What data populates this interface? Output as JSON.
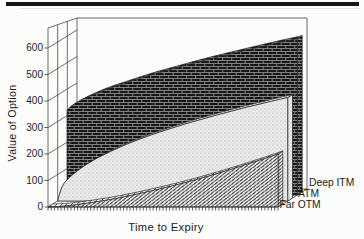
{
  "figure": {
    "kind": "scanned textbook 3D area chart",
    "top_rule_color": "#151515",
    "background": "#fcfcfa"
  },
  "chart_data": {
    "type": "area",
    "projection": "3d-depth-series",
    "title": "",
    "xlabel": "Time to Expiry",
    "ylabel": "Value of Option",
    "x_range": [
      0,
      1
    ],
    "x_axis_numeric_labels": false,
    "x_minor_tick_count": 70,
    "y_ticks": [
      0,
      100,
      200,
      300,
      400,
      500,
      600
    ],
    "ylim": [
      0,
      660
    ],
    "grid": "perspective gutter lines only",
    "legend_position": "staggered at right ends of depth bands",
    "x": [
      0,
      0.02,
      0.05,
      0.1,
      0.15,
      0.2,
      0.3,
      0.4,
      0.5,
      0.6,
      0.7,
      0.8,
      0.9,
      1
    ],
    "series": [
      {
        "name": "Far OTM",
        "depth_band": 0,
        "pattern": "diagonal-weave",
        "ink": "#202020",
        "base": "#f7f7f5",
        "values": [
          0,
          1,
          2,
          6,
          12,
          18,
          33,
          51,
          71,
          93,
          117,
          143,
          171,
          200
        ]
      },
      {
        "name": "ATM",
        "depth_band": 1,
        "pattern": "light-stipple",
        "ink": "#a0a09e",
        "base": "#ebebea",
        "values": [
          0,
          55,
          87,
          123,
          151,
          174,
          214,
          247,
          276,
          302,
          326,
          349,
          370,
          390
        ]
      },
      {
        "name": "Deep ITM",
        "depth_band": 2,
        "pattern": "dark-brick",
        "ink": "#9a9a9a",
        "base": "#181818",
        "values": [
          320,
          337,
          353,
          374,
          392,
          407,
          436,
          462,
          486,
          509,
          530,
          551,
          571,
          590
        ]
      }
    ]
  }
}
